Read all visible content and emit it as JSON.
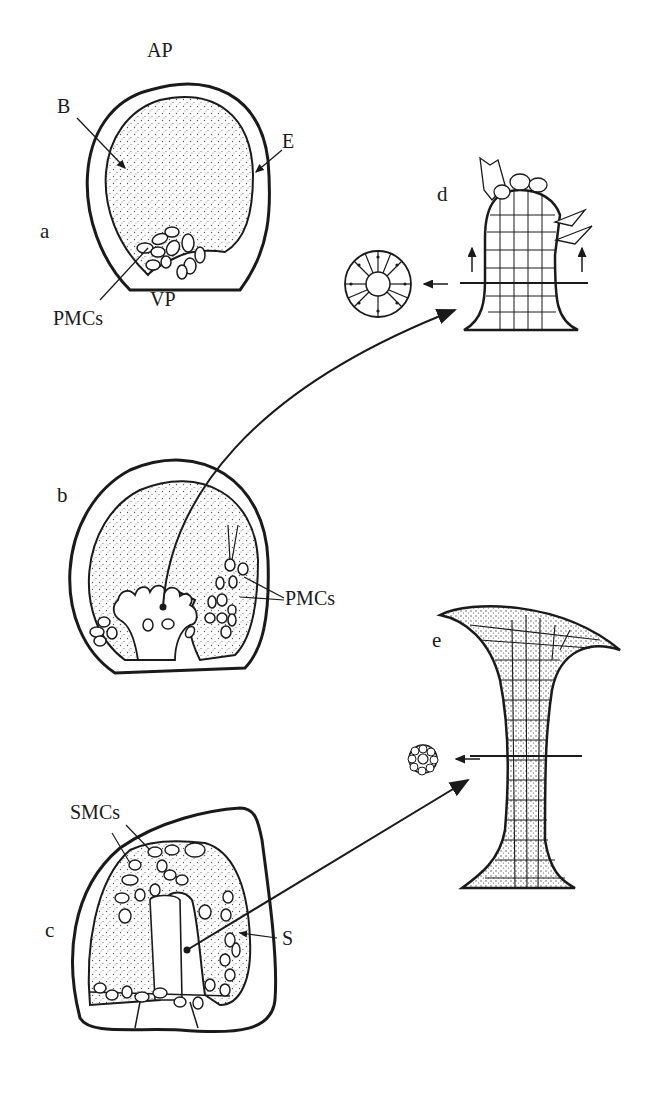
{
  "figure": {
    "colors": {
      "ink": "#1a1a1a",
      "stipple": "#555555",
      "background": "#ffffff"
    },
    "panels": [
      {
        "id": "a",
        "letter": "a",
        "labels": {
          "animal_pole": "AP",
          "blastocoel": "B",
          "ectoderm": "E",
          "vegetal_pole": "VP",
          "pmcs": "PMCs"
        }
      },
      {
        "id": "b",
        "letter": "b",
        "labels": {
          "pmcs": "PMCs"
        }
      },
      {
        "id": "c",
        "letter": "c",
        "labels": {
          "smcs": "SMCs",
          "spicule": "S"
        }
      },
      {
        "id": "d",
        "letter": "d",
        "labels": {}
      },
      {
        "id": "e",
        "letter": "e",
        "labels": {}
      }
    ]
  }
}
